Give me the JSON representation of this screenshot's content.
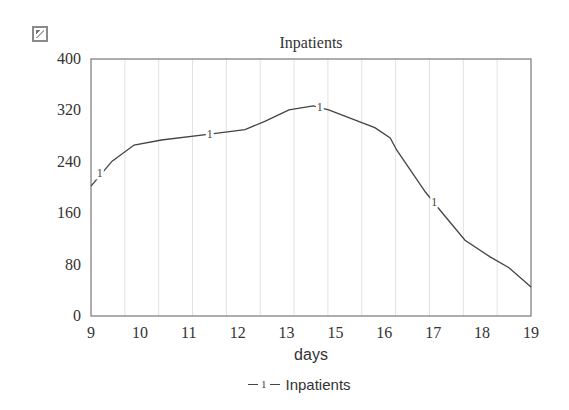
{
  "toolbar": {
    "corner_icon": "export-icon"
  },
  "chart_data": {
    "type": "line",
    "title": "Inpatients",
    "xlabel": "days",
    "ylabel": "",
    "xlim": [
      9,
      19
    ],
    "ylim": [
      0,
      400
    ],
    "x_tick_labels": [
      "9",
      "10",
      "11",
      "12",
      "13",
      "15",
      "16",
      "17",
      "18",
      "19"
    ],
    "y_tick_labels": [
      "0",
      "80",
      "160",
      "240",
      "320",
      "400"
    ],
    "y_ticks": [
      0,
      80,
      160,
      240,
      320,
      400
    ],
    "grid": {
      "vertical": true,
      "horizontal": false,
      "vertical_count": 13
    },
    "legend": {
      "position": "bottom",
      "entries": [
        {
          "marker": "1",
          "label": "Inpatients"
        }
      ]
    },
    "series": [
      {
        "name": "Inpatients",
        "marker_label": "1",
        "color": "#444444",
        "x": [
          9.0,
          9.48,
          9.98,
          10.6,
          11.7,
          12.5,
          12.95,
          13.5,
          14.05,
          14.4,
          15.45,
          15.8,
          15.95,
          16.6,
          16.93,
          17.5,
          18.07,
          18.5,
          19.0
        ],
        "values": [
          202,
          241,
          266,
          274,
          283,
          290,
          303,
          321,
          327,
          321,
          293,
          277,
          258,
          193,
          165,
          118,
          92,
          75,
          45
        ],
        "marker_positions": [
          {
            "x": 9.2,
            "y": 222
          },
          {
            "x": 11.7,
            "y": 283
          },
          {
            "x": 14.2,
            "y": 326
          },
          {
            "x": 16.8,
            "y": 178
          }
        ]
      }
    ]
  }
}
